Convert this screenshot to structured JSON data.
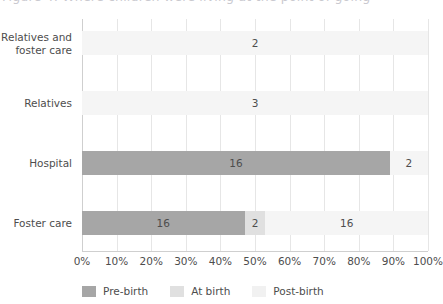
{
  "chart_title_partial": "Figure 4: Where children were living at the point of going",
  "chart_data": {
    "type": "bar",
    "orientation": "horizontal",
    "stacked": "100%",
    "title": "",
    "xlabel": "",
    "ylabel": "",
    "xlim": [
      0,
      100
    ],
    "grid": true,
    "legend_position": "bottom",
    "categories": [
      "Relatives and\nfoster care",
      "Relatives",
      "Hospital",
      "Foster care"
    ],
    "series": [
      {
        "name": "Pre-birth",
        "color": "#a6a6a6",
        "values": [
          0,
          0,
          16,
          16
        ]
      },
      {
        "name": "At birth",
        "color": "#e0e0e0",
        "values": [
          0,
          0,
          0,
          2
        ]
      },
      {
        "name": "Post-birth",
        "color": "#f5f5f5",
        "values": [
          2,
          3,
          2,
          16
        ]
      }
    ],
    "xticks": [
      "0%",
      "10%",
      "20%",
      "30%",
      "40%",
      "50%",
      "60%",
      "70%",
      "80%",
      "90%",
      "100%"
    ],
    "rows": [
      {
        "category_line1": "Relatives and",
        "category_line2": "foster care",
        "segments": [
          {
            "series": "Post-birth",
            "label": "2",
            "start_pct": 0,
            "end_pct": 100,
            "color": "#f5f5f5"
          }
        ]
      },
      {
        "category_line1": "Relatives",
        "category_line2": "",
        "segments": [
          {
            "series": "Post-birth",
            "label": "3",
            "start_pct": 0,
            "end_pct": 100,
            "color": "#f5f5f5"
          }
        ]
      },
      {
        "category_line1": "Hospital",
        "category_line2": "",
        "segments": [
          {
            "series": "Pre-birth",
            "label": "16",
            "start_pct": 0,
            "end_pct": 89,
            "color": "#a6a6a6"
          },
          {
            "series": "Post-birth",
            "label": "2",
            "start_pct": 89,
            "end_pct": 100,
            "color": "#f5f5f5"
          }
        ]
      },
      {
        "category_line1": "Foster care",
        "category_line2": "",
        "segments": [
          {
            "series": "Pre-birth",
            "label": "16",
            "start_pct": 0,
            "end_pct": 47,
            "color": "#a6a6a6"
          },
          {
            "series": "At birth",
            "label": "2",
            "start_pct": 47,
            "end_pct": 53,
            "color": "#e0e0e0"
          },
          {
            "series": "Post-birth",
            "label": "16",
            "start_pct": 53,
            "end_pct": 100,
            "color": "#f5f5f5"
          }
        ]
      }
    ],
    "legend": [
      {
        "label": "Pre-birth",
        "color": "#a6a6a6"
      },
      {
        "label": "At birth",
        "color": "#e0e0e0"
      },
      {
        "label": "Post-birth",
        "color": "#f1f1f1"
      }
    ]
  }
}
